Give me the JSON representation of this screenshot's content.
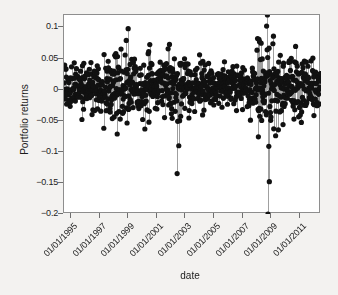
{
  "chart_data": {
    "type": "line",
    "title": "",
    "subtitle": "",
    "xlabel": "date",
    "ylabel": "Portfolio returns",
    "style": "stem",
    "grid": false,
    "legend": null,
    "marker": {
      "shape": "circle",
      "color": "#111111",
      "size_px": 2.6
    },
    "stem_color": "#a0a0a0",
    "baseline": 0,
    "frame_color": "#8e8e8e",
    "background": "#ffffff",
    "page_background": "#f3f2f0",
    "xlim": [
      "07/01/1994",
      "07/01/2012"
    ],
    "ylim": [
      -0.2,
      0.12
    ],
    "yticks": [
      0.1,
      0.05,
      0,
      -0.05,
      -0.1,
      -0.15,
      -0.2
    ],
    "ytick_labels": [
      "0.1",
      "0.05",
      "0",
      "−0.05",
      "−0.1",
      "−0.15",
      "−0.2"
    ],
    "xticks": [
      "01/01/1995",
      "01/01/1997",
      "01/01/1999",
      "01/01/2001",
      "01/01/2003",
      "01/01/2005",
      "01/01/2007",
      "01/01/2009",
      "01/01/2011"
    ],
    "xtick_labels": [
      "01/01/1995",
      "01/01/1997",
      "01/01/1999",
      "01/01/2001",
      "01/01/2003",
      "01/01/2005",
      "01/01/2007",
      "01/01/2009",
      "01/01/2011"
    ],
    "sampling": "weekly",
    "n_points": 940,
    "series": [
      {
        "name": "Portfolio returns",
        "description": "Weekly portfolio returns, mean near +0.004, volatility clustering with large drawdowns in 2002 and 2008-2009",
        "annotations": [
          {
            "date": "01/01/1999",
            "value": 0.098,
            "note": "largest pre-crisis positive spike"
          },
          {
            "date": "06/01/2002",
            "value": -0.135,
            "note": "2002 bear-market outlier"
          },
          {
            "date": "10/01/2008",
            "value": 0.12,
            "note": "crisis rebound spike, top of axis"
          },
          {
            "date": "10/15/2008",
            "value": -0.2,
            "note": "crisis crash, clipped at axis minimum"
          },
          {
            "date": "11/20/2008",
            "value": -0.148,
            "note": "secondary crisis low"
          },
          {
            "date": "03/01/2009",
            "value": 0.086,
            "note": "post-crisis rally"
          }
        ],
        "volatility_profile": [
          {
            "year": 1994,
            "sigma": 0.019
          },
          {
            "year": 1995,
            "sigma": 0.017
          },
          {
            "year": 1996,
            "sigma": 0.018
          },
          {
            "year": 1997,
            "sigma": 0.021
          },
          {
            "year": 1998,
            "sigma": 0.026
          },
          {
            "year": 1999,
            "sigma": 0.024
          },
          {
            "year": 2000,
            "sigma": 0.025
          },
          {
            "year": 2001,
            "sigma": 0.028
          },
          {
            "year": 2002,
            "sigma": 0.031
          },
          {
            "year": 2003,
            "sigma": 0.022
          },
          {
            "year": 2004,
            "sigma": 0.017
          },
          {
            "year": 2005,
            "sigma": 0.015
          },
          {
            "year": 2006,
            "sigma": 0.015
          },
          {
            "year": 2007,
            "sigma": 0.019
          },
          {
            "year": 2008,
            "sigma": 0.046
          },
          {
            "year": 2009,
            "sigma": 0.034
          },
          {
            "year": 2010,
            "sigma": 0.024
          },
          {
            "year": 2011,
            "sigma": 0.028
          },
          {
            "year": 2012,
            "sigma": 0.023
          }
        ]
      }
    ]
  }
}
